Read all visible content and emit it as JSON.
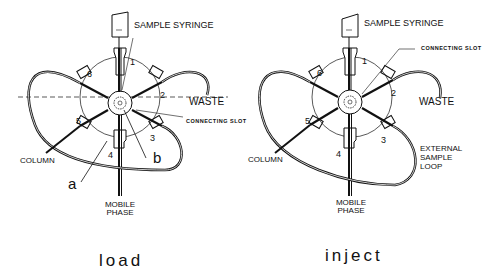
{
  "panels": [
    {
      "id": "load",
      "caption": "load",
      "labels": {
        "sample_syringe": "SAMPLE SYRINGE",
        "waste": "WASTE",
        "connecting_slot": "CONNECTING SLOT",
        "column": "COLUMN",
        "mobile_phase_1": "MOBILE",
        "mobile_phase_2": "PHASE",
        "a": "a",
        "b": "b"
      },
      "ports": [
        "1",
        "2",
        "3",
        "4",
        "5",
        "6"
      ]
    },
    {
      "id": "inject",
      "caption": "inject",
      "labels": {
        "sample_syringe": "SAMPLE SYRINGE",
        "waste": "WASTE",
        "connecting_slot": "CONNECTING SLOT",
        "column": "COLUMN",
        "mobile_phase_1": "MOBILE",
        "mobile_phase_2": "PHASE",
        "loop_1": "EXTERNAL",
        "loop_2": "SAMPLE",
        "loop_3": "LOOP"
      },
      "ports": [
        "1",
        "2",
        "3",
        "4",
        "5",
        "6"
      ]
    }
  ],
  "colors": {
    "ink": "#111111",
    "background": "#ffffff"
  }
}
